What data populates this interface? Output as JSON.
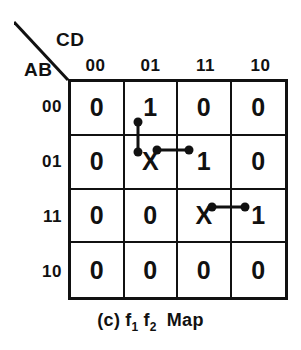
{
  "figure": {
    "caption_prefix": "(c)",
    "caption_f1": "f",
    "caption_f1_sub": "1",
    "caption_f2": "f",
    "caption_f2_sub": "2",
    "caption_suffix": "Map",
    "caption_full": "(c) f1 f2 Map",
    "ink_color": "#111111",
    "background_color": "#ffffff"
  },
  "axes": {
    "col_variables_label": "CD",
    "row_variables_label": "AB",
    "col_headers": [
      "00",
      "01",
      "11",
      "10"
    ],
    "row_headers": [
      "00",
      "01",
      "11",
      "10"
    ]
  },
  "chart_data": {
    "type": "table",
    "xlabel": "CD",
    "ylabel": "AB",
    "categories": [
      "00",
      "01",
      "11",
      "10"
    ],
    "row_categories": [
      "00",
      "01",
      "11",
      "10"
    ],
    "grid": true,
    "legend": "none",
    "cells": [
      [
        "0",
        "1",
        "0",
        "0"
      ],
      [
        "0",
        "X",
        "1",
        "0"
      ],
      [
        "0",
        "0",
        "X",
        "1"
      ],
      [
        "0",
        "0",
        "0",
        "0"
      ]
    ],
    "links": [
      {
        "name": "vertical-link-col01-row00-row01",
        "orientation": "vertical",
        "from_cell": {
          "row": "00",
          "col": "01"
        },
        "to_cell": {
          "row": "01",
          "col": "01"
        },
        "x1": 138,
        "y1": 122,
        "x2": 138,
        "y2": 152
      },
      {
        "name": "horizontal-link-row01-col01-col11",
        "orientation": "horizontal",
        "from_cell": {
          "row": "01",
          "col": "01"
        },
        "to_cell": {
          "row": "01",
          "col": "11"
        },
        "x1": 157,
        "y1": 150,
        "x2": 189,
        "y2": 150
      },
      {
        "name": "horizontal-link-row11-col11-col10",
        "orientation": "horizontal",
        "from_cell": {
          "row": "11",
          "col": "11"
        },
        "to_cell": {
          "row": "11",
          "col": "10"
        },
        "x1": 212,
        "y1": 207,
        "x2": 245,
        "y2": 207
      }
    ],
    "corner_diagonal": {
      "x1": 14,
      "y1": 8,
      "x2": 54,
      "y2": 65
    }
  }
}
